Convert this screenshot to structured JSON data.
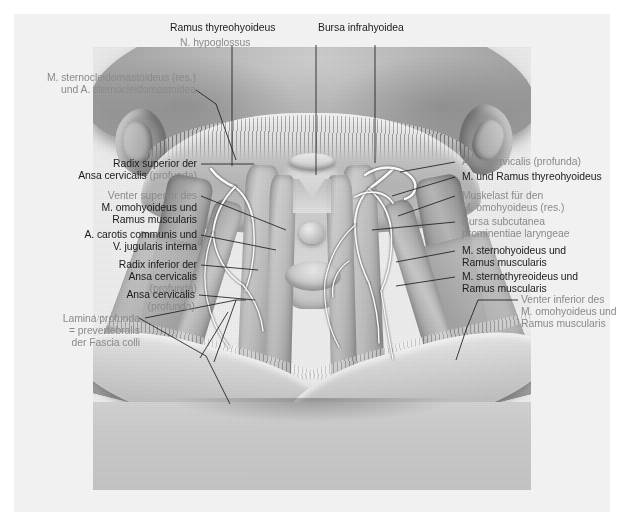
{
  "plate": {
    "title": "Regio cervicalis anterior",
    "figure_alt": "Grayscale anatomical illustration of the anterior neck showing the ansa cervicalis, infrahyoid muscles and laryngeal prominence"
  },
  "labels": {
    "top": [
      {
        "id": "ramus-thyreohyoideus",
        "lines": [
          {
            "text": "Ramus thyreohyoideus",
            "tone": "dark"
          }
        ]
      },
      {
        "id": "n-hypoglossus",
        "lines": [
          {
            "text": "N. hypoglossus",
            "tone": "grey"
          }
        ]
      },
      {
        "id": "bursa-infrahyoidea",
        "lines": [
          {
            "text": "Bursa infrahyoidea",
            "tone": "dark"
          }
        ]
      }
    ],
    "left": [
      {
        "id": "m-sternocleidomastoideus",
        "lines": [
          {
            "text": "M. sternocleidomastoideus (res.)",
            "tone": "grey"
          },
          {
            "text": "und A. sternocleidomastoidea",
            "tone": "grey"
          }
        ]
      },
      {
        "id": "radix-superior-ansa-cervicalis",
        "lines": [
          {
            "text": "Radix superior der",
            "tone": "dark"
          },
          {
            "text": "Ansa cervicalis ",
            "tone": "dark",
            "suffix": "(profunda)"
          }
        ]
      },
      {
        "id": "venter-superior-omohyoideus",
        "lines": [
          {
            "text": "Venter superior des",
            "tone": "grey"
          },
          {
            "text": "M. omohyoideus und",
            "tone": "dark"
          },
          {
            "text": "Ramus muscularis",
            "tone": "dark"
          }
        ]
      },
      {
        "id": "a-carotis-communis",
        "lines": [
          {
            "text": "A. carotis communis und",
            "tone": "dark"
          },
          {
            "text": "V. jugularis interna",
            "tone": "dark"
          }
        ]
      },
      {
        "id": "radix-inferior-ansa-cervicalis",
        "lines": [
          {
            "text": "Radix inferior der",
            "tone": "dark"
          },
          {
            "text": "Ansa cervicalis",
            "tone": "dark"
          },
          {
            "text": "(profunda)",
            "tone": "grey"
          }
        ]
      },
      {
        "id": "ansa-cervicalis",
        "lines": [
          {
            "text": "Ansa cervicalis",
            "tone": "dark"
          },
          {
            "text": "(profunda)",
            "tone": "grey"
          }
        ]
      },
      {
        "id": "lamina-profunda-fascia-colli",
        "lines": [
          {
            "text": "Lamina profunda",
            "tone": "grey"
          },
          {
            "text": "= prevertebralis",
            "tone": "grey"
          },
          {
            "text": "der Fascia colli",
            "tone": "grey"
          }
        ]
      }
    ],
    "right": [
      {
        "id": "ansa-cervicalis-profunda-right",
        "lines": [
          {
            "text": "Ansa cervicalis (profunda)",
            "tone": "grey"
          }
        ]
      },
      {
        "id": "m-und-ramus-thyreohyoideus",
        "lines": [
          {
            "text": "M. und Ramus thyreohyoideus",
            "tone": "dark"
          }
        ]
      },
      {
        "id": "muskelast-omohyoideus",
        "lines": [
          {
            "text": "Muskelast für den",
            "tone": "grey"
          },
          {
            "text": "M. omohyoideus (res.)",
            "tone": "grey"
          }
        ]
      },
      {
        "id": "bursa-subcutanea-prominentiae-laryngeae",
        "lines": [
          {
            "text": "Bursa subcutanea",
            "tone": "grey"
          },
          {
            "text": "prominentiae laryngeae",
            "tone": "grey"
          }
        ]
      },
      {
        "id": "m-sternohyoideus",
        "lines": [
          {
            "text": "M. sternohyoideus und",
            "tone": "dark"
          },
          {
            "text": "Ramus muscularis",
            "tone": "dark"
          }
        ]
      },
      {
        "id": "m-sternothyreoideus",
        "lines": [
          {
            "text": "M. sternothyreoideus und",
            "tone": "dark"
          },
          {
            "text": "Ramus muscularis",
            "tone": "dark"
          }
        ]
      },
      {
        "id": "venter-inferior-omohyoideus",
        "lines": [
          {
            "text": "Venter inferior des",
            "tone": "grey"
          },
          {
            "text": "M. omohyoideus und",
            "tone": "grey"
          },
          {
            "text": "Ramus muscularis",
            "tone": "grey"
          }
        ]
      }
    ]
  },
  "colors": {
    "page_background": "#ffffff",
    "paper_panel": "#f1f1f1",
    "label_dark": "#1b1b1b",
    "label_grey": "#8a8a8a",
    "leader_line": "#1e1e1e"
  }
}
